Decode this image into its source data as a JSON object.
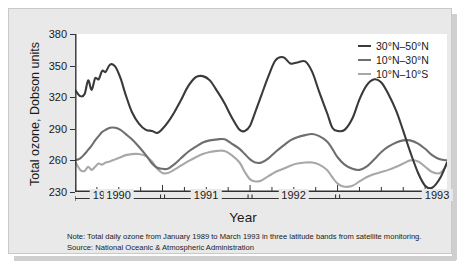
{
  "axes": {
    "ytitle": "Total ozone, Dobson units",
    "xtitle": "Year",
    "yticks": [
      "230",
      "260",
      "290",
      "320",
      "350",
      "380"
    ],
    "xticks": [
      "1989",
      "1990",
      "1991",
      "1992",
      "1993"
    ]
  },
  "legend": {
    "items": [
      {
        "label": "30°N–50°N",
        "color": "#3a3a3a"
      },
      {
        "label": "10°N–30°N",
        "color": "#6e6e6e"
      },
      {
        "label": "10°N–10°S",
        "color": "#a8a8a8"
      }
    ]
  },
  "note": {
    "line1": "Note: Total daily ozone from January 1989 to March 1993 in three latitude bands from satellite monitoring.",
    "line2": "Source: National Oceanic & Atmospheric Administration"
  },
  "chart_data": {
    "type": "line",
    "title": "",
    "xlabel": "Year",
    "ylabel": "Total ozone, Dobson units",
    "ylim": [
      230,
      380
    ],
    "xlim": [
      1989.0,
      1993.25
    ],
    "grid": false,
    "legend_position": "top-right",
    "x": [
      1989.0,
      1989.06,
      1989.11,
      1989.15,
      1989.19,
      1989.23,
      1989.27,
      1989.31,
      1989.35,
      1989.4,
      1989.46,
      1989.52,
      1989.58,
      1989.65,
      1989.73,
      1989.81,
      1989.88,
      1989.94,
      1990.0,
      1990.06,
      1990.13,
      1990.21,
      1990.29,
      1990.38,
      1990.46,
      1990.54,
      1990.63,
      1990.71,
      1990.79,
      1990.88,
      1990.94,
      1991.0,
      1991.06,
      1991.13,
      1991.21,
      1991.29,
      1991.38,
      1991.46,
      1991.54,
      1991.63,
      1991.71,
      1991.79,
      1991.88,
      1991.94,
      1992.0,
      1992.08,
      1992.17,
      1992.25,
      1992.33,
      1992.42,
      1992.5,
      1992.58,
      1992.67,
      1992.75,
      1992.83,
      1992.92,
      1993.0,
      1993.08,
      1993.17,
      1993.25
    ],
    "series": [
      {
        "name": "30°N–50°N",
        "color": "#3a3a3a",
        "values": [
          327,
          321,
          323,
          336,
          327,
          338,
          337,
          345,
          344,
          351,
          349,
          338,
          322,
          306,
          295,
          289,
          288,
          286,
          290,
          296,
          305,
          317,
          330,
          339,
          340,
          336,
          325,
          314,
          301,
          289,
          288,
          293,
          306,
          322,
          340,
          355,
          358,
          352,
          353,
          354,
          344,
          325,
          305,
          291,
          288,
          289,
          300,
          318,
          331,
          337,
          334,
          323,
          307,
          288,
          268,
          248,
          236,
          234,
          243,
          258
        ]
      },
      {
        "name": "10°N–30°N",
        "color": "#6e6e6e",
        "values": [
          260,
          262,
          266,
          270,
          274,
          279,
          283,
          287,
          289,
          291,
          291,
          289,
          285,
          280,
          273,
          265,
          257,
          253,
          252,
          252,
          256,
          262,
          268,
          273,
          277,
          279,
          280,
          280,
          276,
          271,
          266,
          261,
          258,
          258,
          262,
          268,
          274,
          279,
          282,
          284,
          285,
          283,
          278,
          271,
          263,
          256,
          252,
          251,
          254,
          261,
          268,
          273,
          277,
          279,
          279,
          276,
          271,
          265,
          261,
          260
        ]
      },
      {
        "name": "10°N–10°S",
        "color": "#a8a8a8",
        "values": [
          259,
          251,
          250,
          254,
          251,
          254,
          257,
          256,
          258,
          259,
          261,
          263,
          265,
          266,
          266,
          264,
          259,
          252,
          248,
          248,
          251,
          255,
          259,
          263,
          266,
          268,
          269,
          269,
          265,
          258,
          249,
          242,
          240,
          241,
          245,
          249,
          252,
          255,
          257,
          258,
          258,
          256,
          251,
          244,
          238,
          235,
          236,
          240,
          244,
          247,
          249,
          251,
          254,
          257,
          260,
          259,
          254,
          249,
          248,
          256
        ]
      }
    ]
  }
}
